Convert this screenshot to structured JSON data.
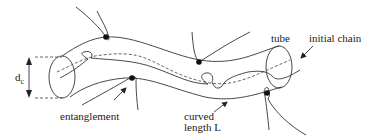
{
  "diagram": {
    "labels": {
      "diameter_main": "d",
      "diameter_sub": "c",
      "entanglement": "entanglement",
      "curved_line1": "curved",
      "curved_line2": "length L",
      "tube": "tube",
      "initial_chain": "initial chain"
    },
    "elements": [
      {
        "id": "tube",
        "type": "cylinder-tube",
        "label": "tube"
      },
      {
        "id": "initial-chain",
        "type": "dashed-curve",
        "label": "initial chain"
      },
      {
        "id": "current-chain",
        "type": "solid-curve"
      },
      {
        "id": "entanglement-points",
        "type": "dot",
        "count": 4
      },
      {
        "id": "tube-diameter",
        "type": "double-arrow",
        "label": "d_c"
      },
      {
        "id": "curved-length",
        "type": "arrow",
        "label": "curved length L"
      }
    ],
    "colors": {
      "stroke": "#333333",
      "dot": "#111111",
      "background": "#ffffff"
    }
  }
}
